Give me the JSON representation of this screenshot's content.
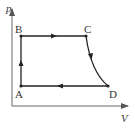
{
  "diagram": {
    "type": "p-V cycle",
    "axes": {
      "y_label": "p",
      "x_label": "V"
    },
    "points": [
      {
        "name": "A",
        "x": 21,
        "y": 86
      },
      {
        "name": "B",
        "x": 21,
        "y": 36
      },
      {
        "name": "C",
        "x": 86,
        "y": 36
      },
      {
        "name": "D",
        "x": 108,
        "y": 86
      }
    ],
    "labels": {
      "A": "A",
      "B": "B",
      "C": "C",
      "D": "D"
    },
    "processes": [
      {
        "from": "A",
        "to": "B",
        "shape": "vertical line",
        "arrow": "up"
      },
      {
        "from": "B",
        "to": "C",
        "shape": "horizontal line",
        "arrow": "right"
      },
      {
        "from": "C",
        "to": "D",
        "shape": "curve",
        "arrow": "down"
      },
      {
        "from": "D",
        "to": "A",
        "shape": "horizontal line",
        "arrow": "left"
      }
    ],
    "line_color": "#222222"
  }
}
